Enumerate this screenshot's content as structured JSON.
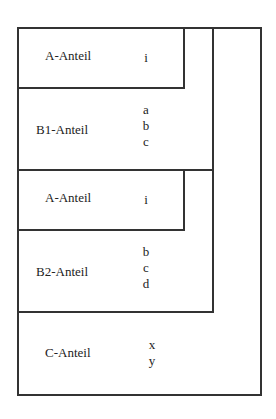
{
  "diagram": {
    "sections": [
      {
        "id": "a1",
        "label": "A-Anteil",
        "letters": [
          "i"
        ]
      },
      {
        "id": "b1",
        "label": "B1-Anteil",
        "letters": [
          "a",
          "b",
          "c"
        ]
      },
      {
        "id": "a2",
        "label": "A-Anteil",
        "letters": [
          "i"
        ]
      },
      {
        "id": "b2",
        "label": "B2-Anteil",
        "letters": [
          "b",
          "c",
          "d"
        ]
      },
      {
        "id": "c",
        "label": "C-Anteil",
        "letters": [
          "x",
          "y"
        ]
      }
    ]
  }
}
